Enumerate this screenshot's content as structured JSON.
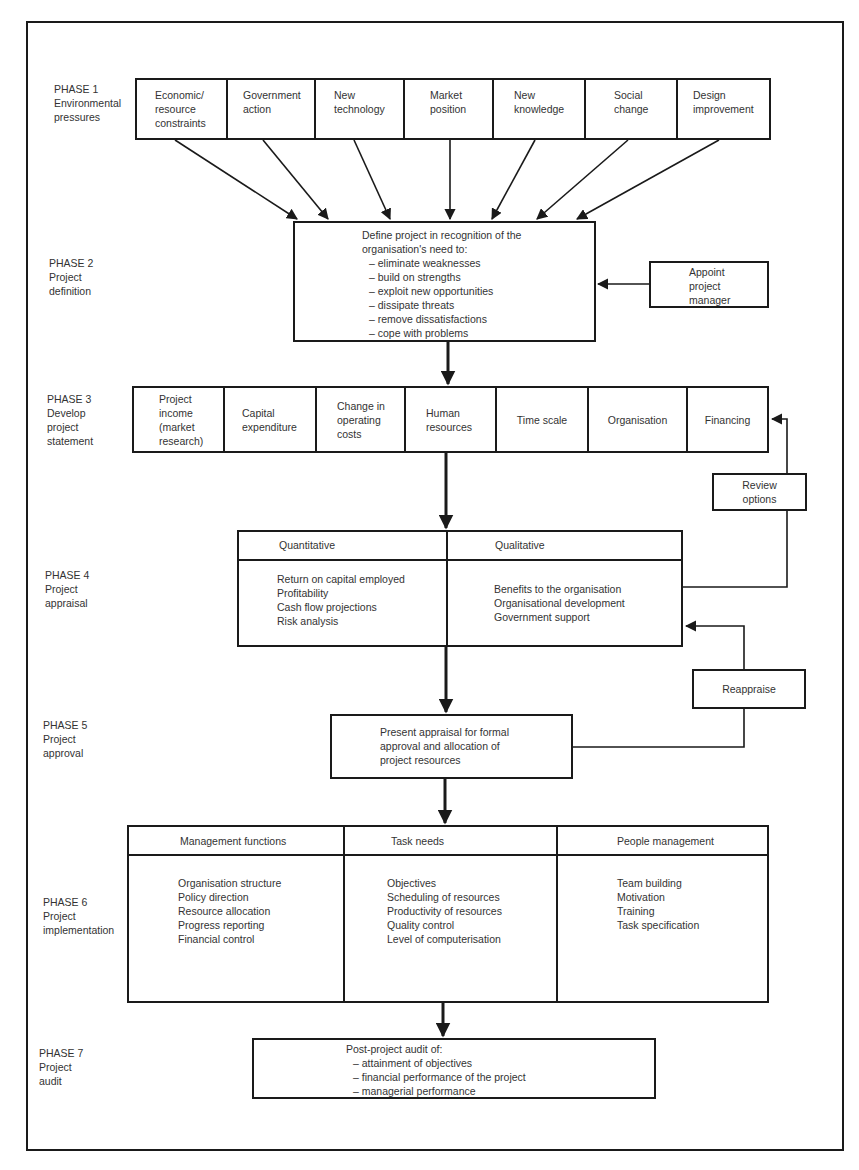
{
  "phases": [
    {
      "id": 1,
      "label": "PHASE 1",
      "title_lines": [
        "Environmental",
        "pressures"
      ]
    },
    {
      "id": 2,
      "label": "PHASE 2",
      "title_lines": [
        "Project",
        "definition"
      ]
    },
    {
      "id": 3,
      "label": "PHASE 3",
      "title_lines": [
        "Develop",
        "project",
        "statement"
      ]
    },
    {
      "id": 4,
      "label": "PHASE 4",
      "title_lines": [
        "Project",
        "appraisal"
      ]
    },
    {
      "id": 5,
      "label": "PHASE 5",
      "title_lines": [
        "Project",
        "approval"
      ]
    },
    {
      "id": 6,
      "label": "PHASE 6",
      "title_lines": [
        "Project",
        "implementation"
      ]
    },
    {
      "id": 7,
      "label": "PHASE 7",
      "title_lines": [
        "Project",
        "audit"
      ]
    }
  ],
  "phase1": {
    "pressures": [
      {
        "lines": [
          "Economic/",
          "resource",
          "constraints"
        ]
      },
      {
        "lines": [
          "Government",
          "action"
        ]
      },
      {
        "lines": [
          "New",
          "technology"
        ]
      },
      {
        "lines": [
          "Market",
          "position"
        ]
      },
      {
        "lines": [
          "New",
          "knowledge"
        ]
      },
      {
        "lines": [
          "Social",
          "change"
        ]
      },
      {
        "lines": [
          "Design",
          "improvement"
        ]
      }
    ]
  },
  "phase2": {
    "intro_lines": [
      "Define project in recognition of the",
      "organisation's need to:"
    ],
    "needs": [
      "–  eliminate weaknesses",
      "–  build on strengths",
      "–  exploit new opportunities",
      "–  dissipate threats",
      "–  remove dissatisfactions",
      "–  cope with problems"
    ],
    "side_box": {
      "lines": [
        "Appoint",
        "project",
        "manager"
      ]
    }
  },
  "phase3": {
    "items": [
      {
        "lines": [
          "Project",
          "income",
          "(market",
          "research)"
        ]
      },
      {
        "lines": [
          "Capital",
          "expenditure"
        ]
      },
      {
        "lines": [
          "Change in",
          "operating",
          "costs"
        ]
      },
      {
        "lines": [
          "Human",
          "resources"
        ]
      },
      {
        "lines": [
          "Time scale"
        ]
      },
      {
        "lines": [
          "Organisation"
        ]
      },
      {
        "lines": [
          "Financing"
        ]
      }
    ],
    "feedback_box": {
      "lines": [
        "Review",
        "options"
      ]
    }
  },
  "phase4": {
    "columns": [
      {
        "header": "Quantitative",
        "items": [
          "Return on capital employed",
          "Profitability",
          "Cash flow projections",
          "Risk analysis"
        ]
      },
      {
        "header": "Qualitative",
        "items": [
          "Benefits to the organisation",
          "Organisational development",
          "Government support"
        ]
      }
    ],
    "feedback_box": {
      "label": "Reappraise"
    }
  },
  "phase5": {
    "lines": [
      "Present appraisal for formal",
      "approval and allocation of",
      "project resources"
    ]
  },
  "phase6": {
    "columns": [
      {
        "header": "Management functions",
        "items": [
          "Organisation structure",
          "Policy direction",
          "Resource allocation",
          "Progress reporting",
          "Financial control"
        ]
      },
      {
        "header": "Task needs",
        "items": [
          "Objectives",
          "Scheduling of resources",
          "Productivity of resources",
          "Quality control",
          "Level of computerisation"
        ]
      },
      {
        "header": "People management",
        "items": [
          "Team building",
          "Motivation",
          "Training",
          "Task specification"
        ]
      }
    ]
  },
  "phase7": {
    "intro": "Post-project audit of:",
    "items": [
      "–  attainment of objectives",
      "–  financial performance of the project",
      "–  managerial performance"
    ]
  }
}
